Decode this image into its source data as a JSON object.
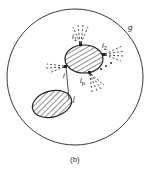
{
  "diagram": {
    "caption": "(b)",
    "outer_label": "g",
    "nodes": [
      {
        "id": "upper",
        "labels": [
          "i1",
          "i2",
          "i",
          "ip"
        ]
      },
      {
        "id": "lower",
        "label": "j"
      }
    ],
    "labels": {
      "g": "g",
      "i1_main": "i",
      "i1_sub": "1",
      "i2_main": "i",
      "i2_sub": "2",
      "i": "i",
      "ip_main": "i",
      "ip_sub": "p",
      "j": "j",
      "dots": "• • •"
    },
    "colors": {
      "stroke": "#222222",
      "background": "#ffffff"
    }
  }
}
